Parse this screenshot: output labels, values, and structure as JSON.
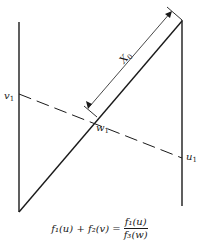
{
  "diagram": {
    "type": "nomogram",
    "labels": {
      "v": "v",
      "v_sub": "1",
      "u": "u",
      "u_sub": "1",
      "w": "w",
      "w_sub": "1",
      "x": "X",
      "x_sub": "0"
    },
    "equation": {
      "lhs": "f₁(u) + f₂(v) =",
      "numerator": "f₁(u)",
      "denominator": "f₃(w)"
    },
    "colors": {
      "stroke": "#1a1a1a",
      "background": "#ffffff"
    }
  }
}
